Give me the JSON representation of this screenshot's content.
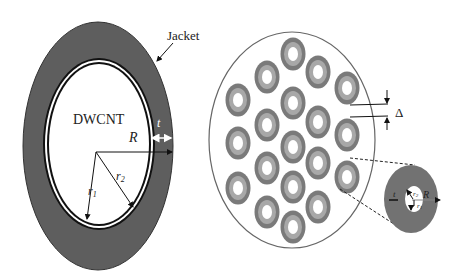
{
  "left_panel": {
    "title_label": "DWCNT",
    "jacket_label": "Jacket",
    "labels": {
      "R": "R",
      "t": "t",
      "r1": "r",
      "r1_sub": "1",
      "r2": "r",
      "r2_sub": "2"
    }
  },
  "right_panel": {
    "delta_label": "Δ",
    "fiber_count": 19,
    "fibers": [
      {
        "cx": 238,
        "cy": 100
      },
      {
        "cx": 238,
        "cy": 143
      },
      {
        "cx": 238,
        "cy": 188
      },
      {
        "cx": 267,
        "cy": 77
      },
      {
        "cx": 267,
        "cy": 125
      },
      {
        "cx": 267,
        "cy": 168
      },
      {
        "cx": 267,
        "cy": 212
      },
      {
        "cx": 293,
        "cy": 54
      },
      {
        "cx": 293,
        "cy": 103
      },
      {
        "cx": 293,
        "cy": 147
      },
      {
        "cx": 293,
        "cy": 187
      },
      {
        "cx": 293,
        "cy": 227
      },
      {
        "cx": 318,
        "cy": 72
      },
      {
        "cx": 318,
        "cy": 122
      },
      {
        "cx": 318,
        "cy": 163
      },
      {
        "cx": 318,
        "cy": 207
      },
      {
        "cx": 347,
        "cy": 88
      },
      {
        "cx": 347,
        "cy": 135
      },
      {
        "cx": 347,
        "cy": 177
      }
    ],
    "inset": {
      "labels": {
        "t": "t",
        "R": "R",
        "r1": "r",
        "r1_sub": "1",
        "r2": "r",
        "r2_sub": "2"
      }
    }
  },
  "colors": {
    "jacket": "#5e5e5e",
    "ring": "#111111",
    "fiber_outer": "#7a7a7a",
    "fiber_inner": "#a8a8a8",
    "outline": "#666666"
  }
}
